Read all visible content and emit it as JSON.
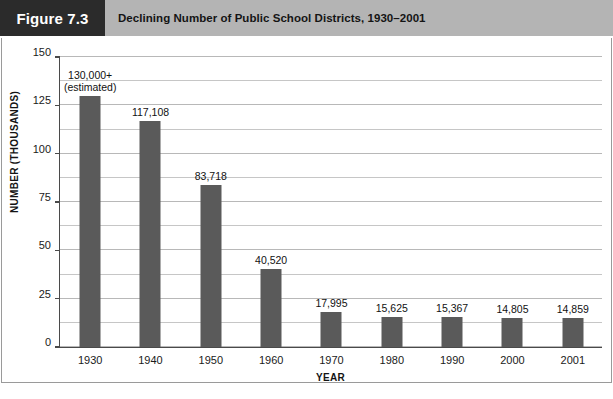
{
  "figure": {
    "number_label": "Figure 7.3",
    "title": "Declining Number of Public School Districts, 1930–2001"
  },
  "chart_data": {
    "type": "bar",
    "title": "Declining Number of Public School Districts, 1930–2001",
    "xlabel": "YEAR",
    "ylabel": "NUMBER (THOUSANDS)",
    "ylim": [
      0,
      150
    ],
    "y_ticks": [
      0,
      25,
      50,
      75,
      100,
      125,
      150
    ],
    "y_tick_labels": [
      "0",
      "25",
      "50",
      "75",
      "100",
      "125",
      "150"
    ],
    "minor_gridline_step": 12.5,
    "grid": true,
    "legend": null,
    "categories": [
      "1930",
      "1940",
      "1950",
      "1960",
      "1970",
      "1980",
      "1990",
      "2000",
      "2001"
    ],
    "values": [
      130.0,
      117.108,
      83.718,
      40.52,
      17.995,
      15.625,
      15.367,
      14.805,
      14.859
    ],
    "data_labels": [
      {
        "line1": "130,000+",
        "line2": "(estimated)"
      },
      {
        "line1": "117,108",
        "line2": ""
      },
      {
        "line1": "83,718",
        "line2": ""
      },
      {
        "line1": "40,520",
        "line2": ""
      },
      {
        "line1": "17,995",
        "line2": ""
      },
      {
        "line1": "15,625",
        "line2": ""
      },
      {
        "line1": "15,367",
        "line2": ""
      },
      {
        "line1": "14,805",
        "line2": ""
      },
      {
        "line1": "14,859",
        "line2": ""
      }
    ],
    "bar_color": "#5a5a5a",
    "axis_color": "#4a4a4a",
    "gridline_color": "#c6c6c6"
  },
  "colors": {
    "header_band": "#b4b4b4",
    "figure_number_box": "#2b2b2b",
    "figure_number_text": "#ffffff",
    "title_text": "#141414",
    "frame_border": "#9a9a9a"
  }
}
